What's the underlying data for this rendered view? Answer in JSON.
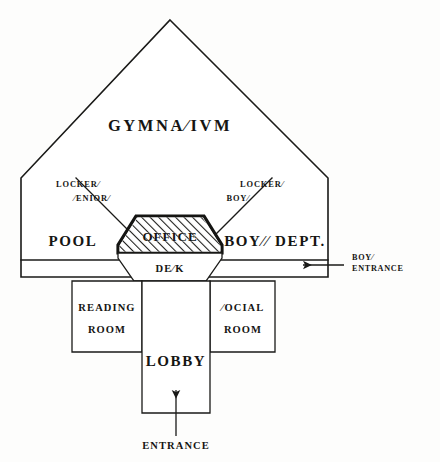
{
  "diagram": {
    "kind": "architectural-floor-plan",
    "style": "hand-drawn ink line drawing, hatched office block",
    "ink_color": "#1a1a18",
    "paper_color": "#fdfdfc"
  },
  "rooms": {
    "gymnasium": {
      "label": "GYMNA⁄IVM",
      "plain": "GYMNASIUM"
    },
    "lockers_seniors": {
      "line1": "LOCKER⁄",
      "line2": "⁄ENIOR⁄",
      "plain": "LOCKERS SENIORS"
    },
    "lockers_boys": {
      "line1": "LOCKER⁄",
      "line2": "BOY⁄",
      "plain": "LOCKERS BOYS"
    },
    "pool": {
      "label": "POOL",
      "plain": "POOL"
    },
    "office": {
      "label": "OFFICE",
      "plain": "OFFICE",
      "hatched": "true"
    },
    "desk": {
      "label": "DE⁄K",
      "plain": "DESK"
    },
    "boys_dept": {
      "label": "BOY⁄⁄ DEPT.",
      "plain": "BOYS DEPT."
    },
    "reading_room": {
      "line1": "READING",
      "line2": "ROOM",
      "plain": "READING ROOM"
    },
    "social_room": {
      "line1": "⁄OCIAL",
      "line2": "ROOM",
      "plain": "SOCIAL ROOM"
    },
    "lobby": {
      "label": "LOBBY",
      "plain": "LOBBY"
    }
  },
  "annotations": {
    "boys_entrance": {
      "line1": "BOY⁄",
      "line2": "ENTRANCE",
      "plain": "BOYS ENTRANCE",
      "arrow": "left-arrow"
    },
    "main_entrance": {
      "label": "ENTRANCE",
      "plain": "ENTRANCE",
      "arrow": "up-arrow"
    }
  },
  "caption": {
    "text": ""
  }
}
